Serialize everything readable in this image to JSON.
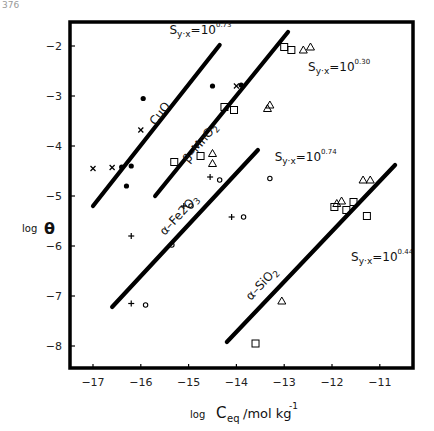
{
  "chart_data": {
    "type": "scatter",
    "title": "",
    "xlabel": "log C_eq/mol kg^-1",
    "xlabel_parts": {
      "prefix": "log",
      "main": "C",
      "sub": "eq",
      "unit": "/mol kg",
      "sup": "-1"
    },
    "ylabel": "log θ",
    "ylabel_parts": {
      "prefix": "log",
      "main": "θ"
    },
    "xlim": [
      -17.5,
      -10.3
    ],
    "ylim": [
      -8.5,
      -1.5
    ],
    "xticks": [
      -17,
      -16,
      -15,
      -14,
      -13,
      -12,
      -11
    ],
    "yticks": [
      -2,
      -3,
      -4,
      -5,
      -6,
      -7,
      -8
    ],
    "grid": false,
    "legend": null,
    "fit_lines": [
      {
        "name": "CuO",
        "x": [
          -17.0,
          -14.35
        ],
        "y": [
          -5.2,
          -1.98
        ],
        "label": "CuO",
        "label_pos": [
          -15.7,
          -3.6
        ],
        "stat": "S",
        "stat_sub": "y·x",
        "stat_eq": "=10",
        "stat_sup": "0.73",
        "stat_pos": [
          -15.4,
          -1.75
        ]
      },
      {
        "name": "β-MnO2",
        "x": [
          -15.7,
          -12.92
        ],
        "y": [
          -5.0,
          -1.72
        ],
        "label": "β–MnO2",
        "label_pos": [
          -15.0,
          -4.35
        ],
        "stat": "S",
        "stat_sub": "y·x",
        "stat_eq": "=10",
        "stat_sup": "0.30",
        "stat_pos": [
          -12.5,
          -2.5
        ]
      },
      {
        "name": "α-Fe2O3",
        "x": [
          -16.6,
          -13.55
        ],
        "y": [
          -7.22,
          -4.08
        ],
        "label": "α–Fe2O3",
        "label_pos": [
          -15.5,
          -5.8
        ],
        "stat": "S",
        "stat_sub": "y·x",
        "stat_eq": "=10",
        "stat_sup": "0.74",
        "stat_pos": [
          -13.2,
          -4.3
        ]
      },
      {
        "name": "α-SiO2",
        "x": [
          -14.2,
          -10.68
        ],
        "y": [
          -7.92,
          -4.38
        ],
        "label": "α–SiO2",
        "label_pos": [
          -13.7,
          -7.1
        ],
        "stat": "S",
        "stat_sub": "y·x",
        "stat_eq": "=10",
        "stat_sup": "0.44",
        "stat_pos": [
          -11.6,
          -6.3
        ]
      }
    ],
    "series": [
      {
        "name": "x-markers",
        "marker": "x",
        "points": [
          [
            -17.0,
            -4.45
          ],
          [
            -16.6,
            -4.43
          ],
          [
            -16.0,
            -3.68
          ],
          [
            -14.0,
            -2.8
          ]
        ]
      },
      {
        "name": "filled-dots",
        "marker": "dot",
        "points": [
          [
            -16.4,
            -4.42
          ],
          [
            -16.2,
            -4.4
          ],
          [
            -16.3,
            -4.8
          ],
          [
            -15.95,
            -3.05
          ],
          [
            -14.5,
            -2.8
          ],
          [
            -13.9,
            -2.78
          ]
        ]
      },
      {
        "name": "squares",
        "marker": "square",
        "points": [
          [
            -15.3,
            -4.32
          ],
          [
            -14.75,
            -4.2
          ],
          [
            -14.25,
            -3.22
          ],
          [
            -14.05,
            -3.28
          ],
          [
            -13.0,
            -2.02
          ],
          [
            -12.85,
            -2.08
          ],
          [
            -11.95,
            -5.22
          ],
          [
            -11.7,
            -5.28
          ],
          [
            -11.55,
            -5.12
          ],
          [
            -13.6,
            -7.95
          ],
          [
            -11.27,
            -5.4
          ]
        ]
      },
      {
        "name": "triangles",
        "marker": "triangle",
        "points": [
          [
            -14.5,
            -4.15
          ],
          [
            -14.5,
            -4.35
          ],
          [
            -13.35,
            -3.25
          ],
          [
            -13.3,
            -3.18
          ],
          [
            -12.6,
            -2.08
          ],
          [
            -12.45,
            -2.02
          ],
          [
            -11.9,
            -5.15
          ],
          [
            -11.8,
            -5.1
          ],
          [
            -11.35,
            -4.68
          ],
          [
            -11.2,
            -4.68
          ],
          [
            -13.05,
            -7.1
          ]
        ]
      },
      {
        "name": "plus-markers",
        "marker": "plus",
        "points": [
          [
            -15.1,
            -5.2
          ],
          [
            -14.55,
            -4.62
          ],
          [
            -14.1,
            -5.42
          ],
          [
            -16.2,
            -5.8
          ],
          [
            -16.2,
            -7.15
          ]
        ]
      },
      {
        "name": "open-circles",
        "marker": "circle",
        "points": [
          [
            -14.95,
            -5.2
          ],
          [
            -14.35,
            -4.68
          ],
          [
            -13.85,
            -5.42
          ],
          [
            -13.3,
            -4.65
          ],
          [
            -15.35,
            -5.98
          ],
          [
            -15.9,
            -7.18
          ]
        ]
      }
    ]
  },
  "page": {
    "corner_label": "376"
  }
}
